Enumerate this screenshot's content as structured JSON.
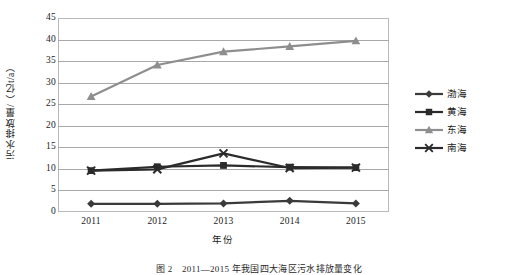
{
  "chart_data": {
    "type": "line",
    "title": "",
    "xlabel": "年份",
    "ylabel": "污水排放量/（亿t/a）",
    "categories": [
      "2011",
      "2012",
      "2013",
      "2014",
      "2015"
    ],
    "x": [
      2011,
      2012,
      2013,
      2014,
      2015
    ],
    "ylim": [
      0,
      45
    ],
    "ytick_step": 5,
    "yticks": [
      "45",
      "40",
      "35",
      "30",
      "25",
      "20",
      "15",
      "10",
      "5",
      "0"
    ],
    "grid": "horizontal",
    "legend_position": "right",
    "series": [
      {
        "name": "渤海",
        "marker": "diamond",
        "color": "#3a3a3a",
        "values": [
          1.9,
          1.9,
          2.0,
          2.6,
          2.0
        ]
      },
      {
        "name": "黄海",
        "marker": "square",
        "color": "#2b2b2b",
        "values": [
          9.6,
          10.5,
          10.8,
          10.4,
          10.3
        ]
      },
      {
        "name": "东海",
        "marker": "triangle",
        "color": "#8e8e8e",
        "values": [
          26.8,
          34.1,
          37.2,
          38.4,
          39.7
        ]
      },
      {
        "name": "南海",
        "marker": "cross-x",
        "color": "#2b2b2b",
        "values": [
          9.6,
          9.9,
          13.6,
          10.2,
          10.3
        ]
      }
    ]
  },
  "caption": "图 2　2011—2015 年我国四大海区污水排放量变化"
}
